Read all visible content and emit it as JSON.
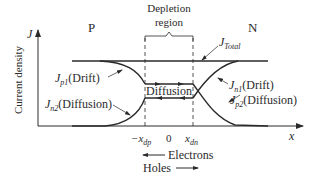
{
  "diagram": {
    "type": "pn-junction-current-density",
    "regions": {
      "p_label": "P",
      "n_label": "N",
      "depletion_line1": "Depletion",
      "depletion_line2": "region"
    },
    "axes": {
      "y_label": "Current density",
      "y_symbol": "J",
      "x_symbol": "x",
      "ticks": {
        "neg_xdp": "−x",
        "neg_xdp_sub": "dp",
        "zero": "0",
        "xdn": "x",
        "xdn_sub": "dn"
      }
    },
    "curves": {
      "total": {
        "sym": "J",
        "sub": "Total",
        "suffix": ""
      },
      "jp1": {
        "sym": "J",
        "sub": "p1",
        "suffix": "(Drift)"
      },
      "jn2": {
        "sym": "J",
        "sub": "n2",
        "suffix": "(Diffusion)"
      },
      "jn1": {
        "sym": "J",
        "sub": "n1",
        "suffix": "(Drift)"
      },
      "jp2": {
        "sym": "J",
        "sub": "p2",
        "suffix": "(Diffusion)"
      }
    },
    "center_label": "Diffusion",
    "legend": {
      "electrons": "Electrons",
      "holes": "Holes"
    },
    "colors": {
      "line": "#2a2a2a",
      "text": "#2a2a2a",
      "background": "#ffffff"
    }
  }
}
